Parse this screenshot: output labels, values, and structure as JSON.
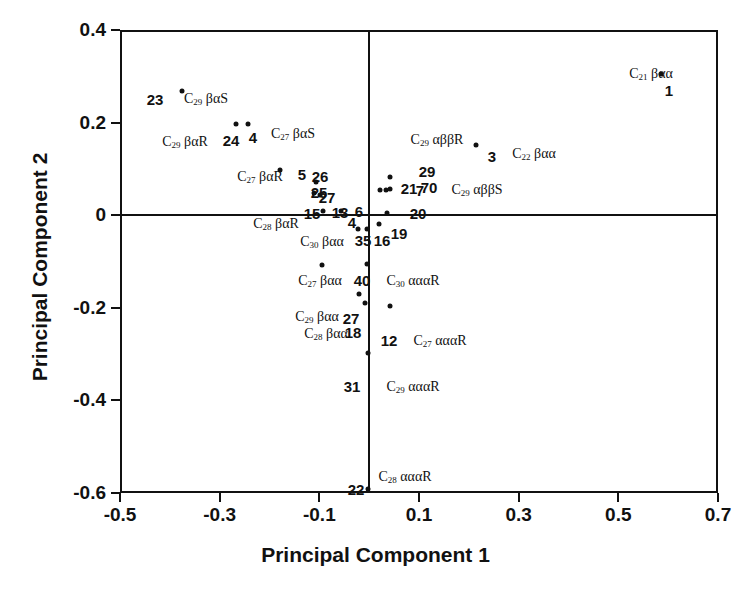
{
  "chart_data": {
    "type": "scatter",
    "title": "",
    "xlabel": "Principal Component 1",
    "ylabel": "Principal Component 2",
    "xlim": [
      -0.5,
      0.7
    ],
    "ylim": [
      -0.6,
      0.4
    ],
    "xticks": [
      "-0.5",
      "-0.3",
      "-0.1",
      "0.1",
      "0.3",
      "0.5",
      "0.7"
    ],
    "xtick_values": [
      -0.5,
      -0.3,
      -0.1,
      0.1,
      0.3,
      0.5,
      0.7
    ],
    "yticks": [
      "0.4",
      "0.2",
      "0",
      "-0.2",
      "-0.4",
      "-0.6"
    ],
    "ytick_values": [
      0.4,
      0.2,
      0,
      -0.2,
      -0.4,
      -0.6
    ],
    "grid": false,
    "legend": "none",
    "origin_lines": true,
    "points": [
      {
        "id": "1",
        "x": 0.585,
        "y": 0.305,
        "compound": "C21 βαα"
      },
      {
        "id": "3",
        "x": 0.215,
        "y": 0.152,
        "compound": "C22 βαα"
      },
      {
        "id": "23",
        "x": -0.375,
        "y": 0.268,
        "compound": "C29 βαS"
      },
      {
        "id": "24",
        "x": -0.268,
        "y": 0.196,
        "compound": "C29 βαR"
      },
      {
        "id": "4",
        "x": -0.243,
        "y": 0.198,
        "compound": "C27 βαS"
      },
      {
        "id": "5",
        "x": -0.178,
        "y": 0.097,
        "compound": "C27 βαR"
      },
      {
        "id": "26",
        "x": -0.106,
        "y": 0.072,
        "compound": ""
      },
      {
        "id": "25",
        "x": -0.11,
        "y": 0.048,
        "compound": ""
      },
      {
        "id": "27",
        "x": -0.098,
        "y": 0.043,
        "compound": ""
      },
      {
        "id": "15",
        "x": -0.093,
        "y": 0.008,
        "compound": "C28 βαR"
      },
      {
        "id": "13",
        "x": -0.056,
        "y": 0.008,
        "compound": ""
      },
      {
        "id": "35",
        "x": -0.022,
        "y": -0.03,
        "compound": "C30 βαα"
      },
      {
        "id": "16",
        "x": -0.005,
        "y": -0.03,
        "compound": ""
      },
      {
        "id": "19",
        "x": 0.02,
        "y": -0.018,
        "compound": ""
      },
      {
        "id": "20",
        "x": 0.035,
        "y": 0.004,
        "compound": ""
      },
      {
        "id": "29",
        "x": 0.042,
        "y": 0.082,
        "compound": "C29 αββR"
      },
      {
        "id": "21",
        "x": 0.022,
        "y": 0.054,
        "compound": ""
      },
      {
        "id": "7",
        "x": 0.033,
        "y": 0.054,
        "compound": ""
      },
      {
        "id": "70",
        "x": 0.042,
        "y": 0.056,
        "compound": "C29 αββS"
      },
      {
        "id": "40",
        "x": -0.005,
        "y": -0.105,
        "compound": "C30 αααR"
      },
      {
        "id": "27b",
        "x": -0.02,
        "y": -0.17,
        "compound": "C29 βαα"
      },
      {
        "id": "18",
        "x": -0.008,
        "y": -0.19,
        "compound": "C28 βαα"
      },
      {
        "id": "12",
        "x": 0.042,
        "y": -0.197,
        "compound": "C27 αααR"
      },
      {
        "id": "31",
        "x": -0.002,
        "y": -0.298,
        "compound": "C29 αααR"
      },
      {
        "id": "22",
        "x": -0.002,
        "y": -0.592,
        "compound": "C28 αααR"
      },
      {
        "id": "40b",
        "x": -0.095,
        "y": -0.108,
        "compound": "C27 βαα"
      }
    ],
    "id_labels": [
      {
        "text": "23",
        "px": 155,
        "py": 99
      },
      {
        "text": "24",
        "px": 231,
        "py": 140
      },
      {
        "text": "4",
        "px": 253,
        "py": 137
      },
      {
        "text": "5",
        "px": 302,
        "py": 174
      },
      {
        "text": "26",
        "px": 320,
        "py": 176
      },
      {
        "text": "25",
        "px": 319,
        "py": 192
      },
      {
        "text": "27",
        "px": 327,
        "py": 197
      },
      {
        "text": "15",
        "px": 312,
        "py": 213
      },
      {
        "text": "13",
        "px": 340,
        "py": 212
      },
      {
        "text": "6",
        "px": 359,
        "py": 211
      },
      {
        "text": "4",
        "px": 352,
        "py": 222
      },
      {
        "text": "35",
        "px": 363,
        "py": 240
      },
      {
        "text": "16",
        "px": 382,
        "py": 240
      },
      {
        "text": "19",
        "px": 399,
        "py": 233
      },
      {
        "text": "20",
        "px": 418,
        "py": 213
      },
      {
        "text": "29",
        "px": 427,
        "py": 171
      },
      {
        "text": "21",
        "px": 409,
        "py": 188
      },
      {
        "text": "7",
        "px": 420,
        "py": 190
      },
      {
        "text": "70",
        "px": 429,
        "py": 187
      },
      {
        "text": "3",
        "px": 492,
        "py": 156
      },
      {
        "text": "1",
        "px": 669,
        "py": 90
      },
      {
        "text": "40",
        "px": 362,
        "py": 280
      },
      {
        "text": "27",
        "px": 351,
        "py": 318
      },
      {
        "text": "18",
        "px": 353,
        "py": 332
      },
      {
        "text": "12",
        "px": 389,
        "py": 340
      },
      {
        "text": "31",
        "px": 352,
        "py": 386
      },
      {
        "text": "22",
        "px": 356,
        "py": 489
      }
    ],
    "chem_labels": [
      {
        "sym": "C",
        "num": "29",
        "suffix": " βαS",
        "px": 206,
        "py": 99
      },
      {
        "sym": "C",
        "num": "29",
        "suffix": " βαR",
        "px": 185,
        "py": 142
      },
      {
        "sym": "C",
        "num": "27",
        "suffix": " βαS",
        "px": 293,
        "py": 134
      },
      {
        "sym": "C",
        "num": "27",
        "suffix": " βαR",
        "px": 260,
        "py": 177
      },
      {
        "sym": "C",
        "num": "28",
        "suffix": " βαR",
        "px": 276,
        "py": 224
      },
      {
        "sym": "C",
        "num": "30",
        "suffix": " βαα",
        "px": 322,
        "py": 242
      },
      {
        "sym": "C",
        "num": "27",
        "suffix": " βαα",
        "px": 320,
        "py": 281
      },
      {
        "sym": "C",
        "num": "29",
        "suffix": " βαα",
        "px": 317,
        "py": 317
      },
      {
        "sym": "C",
        "num": "28",
        "suffix": " βαα",
        "px": 326,
        "py": 334
      },
      {
        "sym": "C",
        "num": "30",
        "suffix": " αααR",
        "px": 413,
        "py": 281
      },
      {
        "sym": "C",
        "num": "27",
        "suffix": " αααR",
        "px": 440,
        "py": 341
      },
      {
        "sym": "C",
        "num": "29",
        "suffix": " αααR",
        "px": 413,
        "py": 387
      },
      {
        "sym": "C",
        "num": "28",
        "suffix": " αααR",
        "px": 405,
        "py": 477
      },
      {
        "sym": "C",
        "num": "29",
        "suffix": " αββR",
        "px": 437,
        "py": 140
      },
      {
        "sym": "C",
        "num": "29",
        "suffix": " αββS",
        "px": 477,
        "py": 190
      },
      {
        "sym": "C",
        "num": "22",
        "suffix": " βαα",
        "px": 534,
        "py": 154
      },
      {
        "sym": "C",
        "num": "21",
        "suffix": " βαα",
        "px": 651,
        "py": 74
      }
    ]
  },
  "axes": {
    "x_title": "Principal Component 1",
    "y_title": "Principal Component 2"
  }
}
